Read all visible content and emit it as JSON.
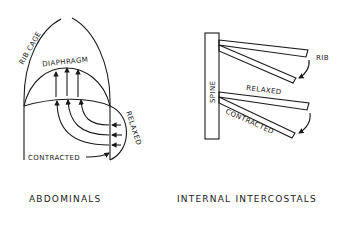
{
  "left_panel": {
    "caption": "ABDOMINALS",
    "labels": {
      "rib_cage": "RIB CAGE",
      "diaphragm": "DIAPHRAGM",
      "relaxed": "RELAXED",
      "contracted": "CONTRACTED"
    }
  },
  "right_panel": {
    "caption": "INTERNAL INTERCOSTALS",
    "labels": {
      "spine": "SPINE",
      "rib": "RIB",
      "relaxed": "RELAXED",
      "contracted": "CONTRACTED"
    }
  },
  "colors": {
    "ink": "#1a1a1a",
    "background": "#ffffff"
  }
}
